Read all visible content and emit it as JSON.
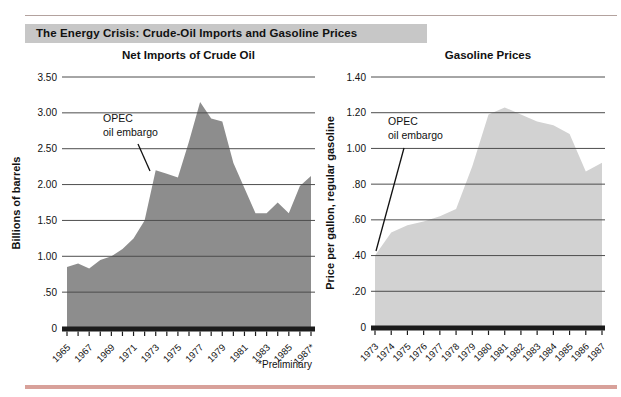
{
  "page": {
    "title": "The Energy Crisis: Crude-Oil Imports and Gasoline Prices",
    "footnote": "*Preliminary"
  },
  "colors": {
    "title_band_bg": "#c7c7c7",
    "top_rule": "#b3a29e",
    "bottom_rule": "#d8a19a",
    "grid_line": "#4d4d4d",
    "axis": "#1b1b1b",
    "text": "#111111",
    "left_area_fill": "#8d8d8d",
    "right_area_fill": "#d2d2d2"
  },
  "chart_data": [
    {
      "type": "area",
      "title": "Net Imports of Crude Oil",
      "ylabel": "Billions of barrels",
      "xlabel": "",
      "ylim": [
        0,
        3.5
      ],
      "ytick_step": 0.5,
      "ytick_labels": [
        "0",
        ".50",
        "1.00",
        "1.50",
        "2.00",
        "2.50",
        "3.00",
        "3.50"
      ],
      "x": [
        1965,
        1966,
        1967,
        1968,
        1969,
        1970,
        1971,
        1972,
        1973,
        1974,
        1975,
        1976,
        1977,
        1978,
        1979,
        1980,
        1981,
        1982,
        1983,
        1984,
        1985,
        1986,
        1987
      ],
      "values": [
        0.85,
        0.9,
        0.83,
        0.95,
        1.0,
        1.1,
        1.25,
        1.5,
        2.2,
        2.15,
        2.1,
        2.6,
        3.15,
        2.92,
        2.88,
        2.3,
        1.95,
        1.6,
        1.6,
        1.75,
        1.6,
        1.98,
        2.12
      ],
      "xtick_labels": [
        "1965",
        "",
        "1967",
        "",
        "1969",
        "",
        "1971",
        "",
        "1973",
        "",
        "1975",
        "",
        "1977",
        "",
        "1979",
        "",
        "1981",
        "",
        "1983",
        "",
        "1985",
        "",
        "1987*"
      ],
      "annotation": {
        "lines": [
          "OPEC",
          "oil embargo"
        ],
        "points_to": {
          "x": 1973,
          "value": 2.2
        }
      },
      "fill": "#8d8d8d",
      "grid": true,
      "legend": null,
      "note": "*Preliminary"
    },
    {
      "type": "area",
      "title": "Gasoline Prices",
      "ylabel": "Price per gallon, regular gasoline",
      "xlabel": "",
      "ylim": [
        0,
        1.4
      ],
      "ytick_step": 0.2,
      "ytick_labels": [
        "0",
        ".20",
        ".40",
        ".60",
        ".80",
        "1.00",
        "1.20",
        "1.40"
      ],
      "x": [
        1973,
        1974,
        1975,
        1976,
        1977,
        1978,
        1979,
        1980,
        1981,
        1982,
        1983,
        1984,
        1985,
        1986,
        1987
      ],
      "values": [
        0.4,
        0.53,
        0.57,
        0.59,
        0.62,
        0.66,
        0.9,
        1.19,
        1.23,
        1.19,
        1.15,
        1.13,
        1.08,
        0.87,
        0.92
      ],
      "xtick_labels": [
        "1973",
        "1974",
        "1975",
        "1976",
        "1977",
        "1978",
        "1979",
        "1980",
        "1981",
        "1982",
        "1983",
        "1984",
        "1985",
        "1986",
        "1987"
      ],
      "annotation": {
        "lines": [
          "OPEC",
          "oil embargo"
        ],
        "points_to": {
          "x": 1973,
          "value": 0.4
        }
      },
      "fill": "#d2d2d2",
      "grid": true,
      "legend": null
    }
  ]
}
